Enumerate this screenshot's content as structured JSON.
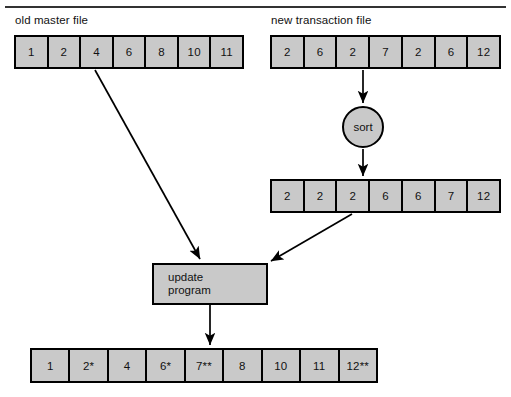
{
  "diagram": {
    "title_rule": "top-divider",
    "captions": {
      "old_master": "old master file",
      "new_transaction": "new transaction file"
    },
    "nodes": {
      "sort": "sort",
      "update_line1": "update",
      "update_line2": "program"
    },
    "tapes": {
      "old_master": [
        "1",
        "2",
        "4",
        "6",
        "8",
        "10",
        "11"
      ],
      "new_transaction": [
        "2",
        "6",
        "2",
        "7",
        "2",
        "6",
        "12"
      ],
      "sorted_transaction": [
        "2",
        "2",
        "2",
        "6",
        "6",
        "7",
        "12"
      ],
      "new_master": [
        "1",
        "2*",
        "4",
        "6*",
        "7**",
        "8",
        "10",
        "11",
        "12**"
      ]
    },
    "colors": {
      "cell_fill": "#c9c9c9",
      "stroke": "#000000",
      "background": "#ffffff",
      "rule": "#333333"
    }
  }
}
